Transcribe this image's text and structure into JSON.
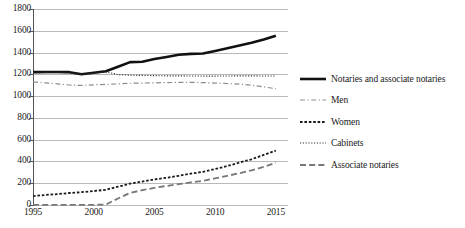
{
  "chart_data": {
    "type": "line",
    "title": "",
    "xlabel": "",
    "ylabel": "",
    "xlim": [
      1995,
      2016
    ],
    "ylim": [
      0,
      1800
    ],
    "ytick_step": 200,
    "grid": true,
    "legend_position": "right",
    "x": [
      1995,
      1996,
      1997,
      1998,
      1999,
      2000,
      2001,
      2002,
      2003,
      2004,
      2005,
      2006,
      2007,
      2008,
      2009,
      2010,
      2011,
      2012,
      2013,
      2014,
      2015
    ],
    "xticks": [
      "1995",
      "2000",
      "2005",
      "2010",
      "2015"
    ],
    "yticks": [
      "0",
      "200",
      "400",
      "600",
      "800",
      "1000",
      "1200",
      "1400",
      "1600",
      "1800"
    ],
    "series": [
      {
        "name": "Notaries and associate notaries",
        "style": "solid",
        "color": "#111111",
        "width": 2.6,
        "values": [
          1220,
          1221,
          1222,
          1220,
          1200,
          1215,
          1228,
          1270,
          1312,
          1315,
          1340,
          1360,
          1380,
          1388,
          1392,
          1415,
          1440,
          1465,
          1490,
          1520,
          1555
        ]
      },
      {
        "name": "Men",
        "style": "dashdot",
        "color": "#8d8d8d",
        "width": 1.2,
        "values": [
          1130,
          1122,
          1112,
          1102,
          1098,
          1104,
          1108,
          1112,
          1118,
          1120,
          1122,
          1124,
          1126,
          1126,
          1124,
          1120,
          1116,
          1110,
          1100,
          1085,
          1068
        ]
      },
      {
        "name": "Women",
        "style": "dotted-short",
        "color": "#1a1a1a",
        "width": 1.8,
        "values": [
          82,
          92,
          100,
          110,
          118,
          128,
          140,
          168,
          196,
          215,
          235,
          250,
          268,
          288,
          305,
          330,
          358,
          390,
          420,
          460,
          500
        ]
      },
      {
        "name": "Cabinets",
        "style": "dotted-fine",
        "color": "#333333",
        "width": 1.1,
        "values": [
          1212,
          1214,
          1215,
          1212,
          1198,
          1210,
          1222,
          1198,
          1192,
          1190,
          1188,
          1186,
          1186,
          1185,
          1184,
          1184,
          1185,
          1186,
          1186,
          1185,
          1185
        ]
      },
      {
        "name": "Associate notaries",
        "style": "dashed-long",
        "color": "#777777",
        "width": 1.8,
        "values": [
          2,
          2,
          2,
          2,
          2,
          2,
          4,
          60,
          112,
          136,
          158,
          175,
          192,
          208,
          222,
          245,
          268,
          292,
          318,
          350,
          388
        ]
      }
    ]
  },
  "legend": {
    "items": [
      {
        "label": "Notaries and associate notaries"
      },
      {
        "label": "Men"
      },
      {
        "label": "Women"
      },
      {
        "label": "Cabinets"
      },
      {
        "label": "Associate notaries"
      }
    ]
  }
}
